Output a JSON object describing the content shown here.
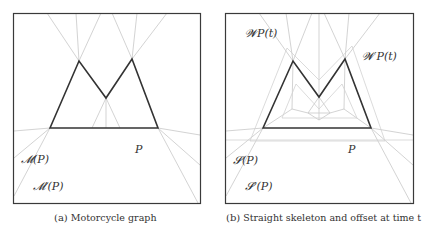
{
  "figure": {
    "panels": [
      {
        "id": "a",
        "caption_tag": "(a)",
        "caption_text": "Motorcycle graph",
        "labels": {
          "m_p": "𝓜(P)",
          "m_prime_p": "𝓜′(P)",
          "polygon": "P"
        }
      },
      {
        "id": "b",
        "caption_tag": "(b)",
        "caption_text": "Straight skeleton and offset at time t",
        "labels": {
          "w_p_t": "𝓦P(t)",
          "w_prime_p_t": "𝓦′P(t)",
          "s_p": "𝓢(P)",
          "s_prime_p": "𝓢′(P)",
          "polygon": "P"
        }
      }
    ],
    "colors": {
      "polygon": "#333333",
      "frame": "#3a3a3a",
      "graph_lines": "#c8c8c8",
      "text": "#333333"
    }
  }
}
